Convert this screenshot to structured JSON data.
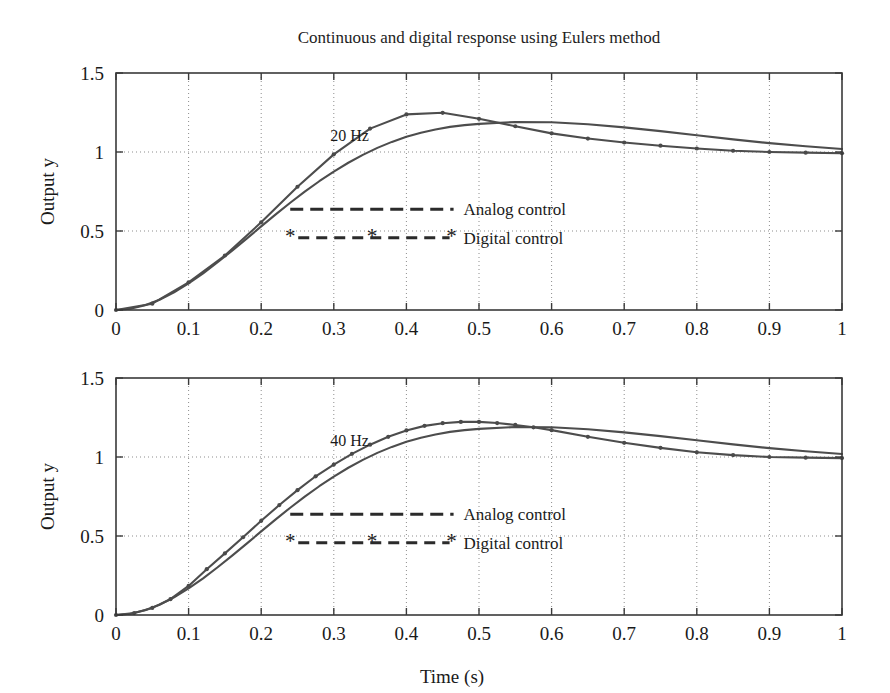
{
  "figure": {
    "title": "Continuous and digital response using Eulers method",
    "xlabel": "Time (s)",
    "ylabel_top": "Output y",
    "ylabel_bottom": "Output y"
  },
  "legend": {
    "analog_label": "Analog control",
    "digital_label": "Digital control",
    "star_glyph": "*"
  },
  "panels": {
    "top_annotation": "20 Hz",
    "bottom_annotation": "40 Hz"
  },
  "axis": {
    "x_ticks": [
      "0",
      "0.1",
      "0.2",
      "0.3",
      "0.4",
      "0.5",
      "0.6",
      "0.7",
      "0.8",
      "0.9",
      "1"
    ],
    "y_ticks": [
      "0",
      "0.5",
      "1",
      "1.5"
    ]
  },
  "colors": {
    "curve": "#4d4d4d",
    "frame": "#3a3a3a",
    "grid": "#8d8d8d",
    "text": "#1a1a1a",
    "background": "#ffffff"
  },
  "chart_data": [
    {
      "type": "line",
      "title": "Continuous and digital response using Eulers method",
      "subtitle": "20 Hz",
      "xlabel": "Time (s)",
      "ylabel": "Output y",
      "xlim": [
        0,
        1
      ],
      "ylim": [
        0,
        1.5
      ],
      "xticks": [
        0,
        0.1,
        0.2,
        0.3,
        0.4,
        0.5,
        0.6,
        0.7,
        0.8,
        0.9,
        1
      ],
      "yticks": [
        0,
        0.5,
        1,
        1.5
      ],
      "grid": true,
      "legend_position": "center-right inside axes",
      "sampling_hz": 20,
      "series": [
        {
          "name": "Analog control",
          "marker": "none",
          "linestyle": "solid",
          "x": [
            0,
            0.02,
            0.04,
            0.06,
            0.08,
            0.1,
            0.12,
            0.14,
            0.16,
            0.18,
            0.2,
            0.22,
            0.24,
            0.26,
            0.28,
            0.3,
            0.32,
            0.34,
            0.36,
            0.38,
            0.4,
            0.42,
            0.44,
            0.46,
            0.48,
            0.5,
            0.55,
            0.6,
            0.65,
            0.7,
            0.75,
            0.8,
            0.85,
            0.9,
            0.95,
            1.0
          ],
          "y": [
            0.0,
            0.008,
            0.03,
            0.065,
            0.112,
            0.168,
            0.232,
            0.302,
            0.376,
            0.452,
            0.529,
            0.605,
            0.679,
            0.749,
            0.815,
            0.876,
            0.932,
            0.982,
            1.026,
            1.064,
            1.096,
            1.122,
            1.143,
            1.159,
            1.17,
            1.178,
            1.19,
            1.188,
            1.176,
            1.156,
            1.132,
            1.106,
            1.08,
            1.056,
            1.036,
            1.019
          ]
        },
        {
          "name": "Digital control",
          "marker": "dot",
          "linestyle": "solid",
          "sample_interval_s": 0.05,
          "x": [
            0,
            0.05,
            0.1,
            0.15,
            0.2,
            0.25,
            0.3,
            0.35,
            0.4,
            0.45,
            0.5,
            0.55,
            0.6,
            0.65,
            0.7,
            0.75,
            0.8,
            0.85,
            0.9,
            0.95,
            1.0
          ],
          "y": [
            0.0,
            0.04,
            0.175,
            0.345,
            0.555,
            0.78,
            0.985,
            1.148,
            1.238,
            1.248,
            1.21,
            1.163,
            1.118,
            1.085,
            1.06,
            1.04,
            1.022,
            1.008,
            1.0,
            0.996,
            0.992
          ]
        }
      ]
    },
    {
      "type": "line",
      "subtitle": "40 Hz",
      "xlabel": "Time (s)",
      "ylabel": "Output y",
      "xlim": [
        0,
        1
      ],
      "ylim": [
        0,
        1.5
      ],
      "xticks": [
        0,
        0.1,
        0.2,
        0.3,
        0.4,
        0.5,
        0.6,
        0.7,
        0.8,
        0.9,
        1
      ],
      "yticks": [
        0,
        0.5,
        1,
        1.5
      ],
      "grid": true,
      "legend_position": "center-right inside axes",
      "sampling_hz": 40,
      "series": [
        {
          "name": "Analog control",
          "marker": "none",
          "linestyle": "solid",
          "x": [
            0,
            0.02,
            0.04,
            0.06,
            0.08,
            0.1,
            0.12,
            0.14,
            0.16,
            0.18,
            0.2,
            0.22,
            0.24,
            0.26,
            0.28,
            0.3,
            0.32,
            0.34,
            0.36,
            0.38,
            0.4,
            0.42,
            0.44,
            0.46,
            0.48,
            0.5,
            0.55,
            0.6,
            0.65,
            0.7,
            0.75,
            0.8,
            0.85,
            0.9,
            0.95,
            1.0
          ],
          "y": [
            0.0,
            0.008,
            0.03,
            0.065,
            0.112,
            0.168,
            0.232,
            0.302,
            0.376,
            0.452,
            0.529,
            0.605,
            0.679,
            0.749,
            0.815,
            0.876,
            0.932,
            0.982,
            1.026,
            1.064,
            1.096,
            1.122,
            1.143,
            1.159,
            1.17,
            1.178,
            1.19,
            1.188,
            1.176,
            1.156,
            1.132,
            1.106,
            1.08,
            1.056,
            1.036,
            1.019
          ]
        },
        {
          "name": "Digital control",
          "marker": "dot",
          "linestyle": "solid",
          "sample_interval_s": 0.025,
          "x": [
            0,
            0.025,
            0.05,
            0.075,
            0.1,
            0.125,
            0.15,
            0.175,
            0.2,
            0.225,
            0.25,
            0.275,
            0.3,
            0.325,
            0.35,
            0.375,
            0.4,
            0.425,
            0.45,
            0.475,
            0.5,
            0.525,
            0.55,
            0.575,
            0.6,
            0.65,
            0.7,
            0.75,
            0.8,
            0.85,
            0.9,
            0.95,
            1.0
          ],
          "y": [
            0.0,
            0.012,
            0.045,
            0.1,
            0.184,
            0.29,
            0.39,
            0.492,
            0.596,
            0.696,
            0.79,
            0.878,
            0.952,
            1.02,
            1.078,
            1.128,
            1.168,
            1.197,
            1.214,
            1.222,
            1.222,
            1.215,
            1.203,
            1.188,
            1.17,
            1.128,
            1.09,
            1.058,
            1.03,
            1.012,
            1.0,
            0.996,
            0.993
          ]
        }
      ]
    }
  ]
}
